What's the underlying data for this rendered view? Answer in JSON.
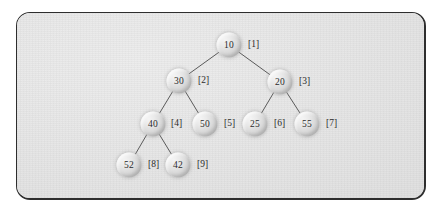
{
  "figure": {
    "kind": "binary-search-tree-diagram",
    "panel": {
      "background_color": "#e6e6e6",
      "border_color": "#2e2e2e"
    },
    "node_style": {
      "shape": "sphere",
      "fill_light": "#f4f4f4",
      "fill_dark": "#b4b4b4",
      "text_color": "#2b2b2b",
      "radius_px": 12.5
    },
    "edge_style": {
      "color": "#5a5a5a",
      "width_px": 1
    }
  },
  "tree": {
    "nodes": [
      {
        "id": "n1",
        "value": "10",
        "index": "[1]",
        "x": 228,
        "y": 44,
        "index_x": 247,
        "index_y": 44
      },
      {
        "id": "n2",
        "value": "30",
        "index": "[2]",
        "x": 178,
        "y": 80,
        "index_x": 197,
        "index_y": 80
      },
      {
        "id": "n3",
        "value": "20",
        "index": "[3]",
        "x": 279,
        "y": 81,
        "index_x": 298,
        "index_y": 81
      },
      {
        "id": "n4",
        "value": "40",
        "index": "[4]",
        "x": 152,
        "y": 123,
        "index_x": 170,
        "index_y": 123
      },
      {
        "id": "n5",
        "value": "50",
        "index": "[5]",
        "x": 204,
        "y": 123,
        "index_x": 223,
        "index_y": 123
      },
      {
        "id": "n6",
        "value": "25",
        "index": "[6]",
        "x": 254,
        "y": 123,
        "index_x": 273,
        "index_y": 123
      },
      {
        "id": "n7",
        "value": "55",
        "index": "[7]",
        "x": 306,
        "y": 123,
        "index_x": 325,
        "index_y": 123
      },
      {
        "id": "n8",
        "value": "52",
        "index": "[8]",
        "x": 128,
        "y": 164,
        "index_x": 147,
        "index_y": 164
      },
      {
        "id": "n9",
        "value": "42",
        "index": "[9]",
        "x": 177,
        "y": 164,
        "index_x": 196,
        "index_y": 164
      }
    ],
    "edges": [
      {
        "from": "n1",
        "to": "n2"
      },
      {
        "from": "n1",
        "to": "n3"
      },
      {
        "from": "n2",
        "to": "n4"
      },
      {
        "from": "n2",
        "to": "n5"
      },
      {
        "from": "n3",
        "to": "n6"
      },
      {
        "from": "n3",
        "to": "n7"
      },
      {
        "from": "n4",
        "to": "n8"
      },
      {
        "from": "n4",
        "to": "n9"
      }
    ]
  }
}
